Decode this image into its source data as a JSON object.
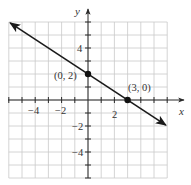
{
  "chart_data": {
    "type": "line",
    "title": "",
    "xlabel": "x",
    "ylabel": "y",
    "xlim": [
      -6,
      6
    ],
    "ylim": [
      -6,
      6
    ],
    "grid": true,
    "grid_step": 1,
    "x_tick_labels": [
      {
        "value": -4,
        "label": "−4"
      },
      {
        "value": -2,
        "label": "−2"
      },
      {
        "value": 2,
        "label": "2"
      }
    ],
    "y_tick_labels": [
      {
        "value": 4,
        "label": "4"
      },
      {
        "value": -2,
        "label": "−2"
      },
      {
        "value": -4,
        "label": "−4"
      }
    ],
    "series": [
      {
        "name": "y = -2/3 x + 2",
        "slope": -0.6667,
        "intercept": 2,
        "x": [
          -5.9,
          5.9
        ],
        "y": [
          5.93,
          -1.93
        ],
        "arrows_both_ends": true,
        "color": "#1a1a1a"
      }
    ],
    "points": [
      {
        "x": 0,
        "y": 2,
        "label": "(0, 2)"
      },
      {
        "x": 3,
        "y": 0,
        "label": "(3, 0)"
      }
    ],
    "annotations": [
      "(0, 2)",
      "(3, 0)"
    ],
    "legend": null
  },
  "labels": {
    "x_axis": "x",
    "y_axis": "y",
    "point_a": "(0, 2)",
    "point_b": "(3, 0)",
    "xt_m4": "−4",
    "xt_m2": "−2",
    "xt_2": "2",
    "yt_4": "4",
    "yt_m2": "−2",
    "yt_m4": "−4"
  },
  "colors": {
    "grid": "#c9c9c9",
    "axis": "#2a2a2a",
    "line": "#1a1a1a",
    "background": "#ffffff"
  }
}
